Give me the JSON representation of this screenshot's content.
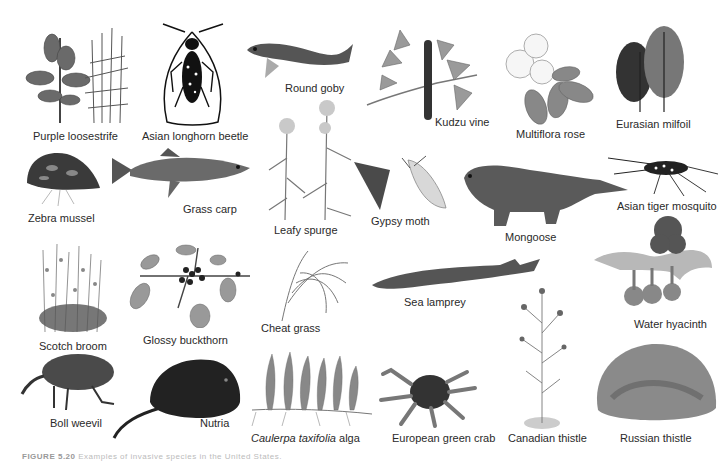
{
  "figure": {
    "caption_prefix": "FIGURE 5.20",
    "caption_text": "Examples of invasive species in the United States.",
    "species": [
      {
        "id": "purple-loosestrife",
        "label": "Purple loosestrife"
      },
      {
        "id": "asian-longhorn-beetle",
        "label": "Asian longhorn beetle"
      },
      {
        "id": "round-goby",
        "label": "Round goby"
      },
      {
        "id": "kudzu-vine",
        "label": "Kudzu vine"
      },
      {
        "id": "multiflora-rose",
        "label": "Multiflora rose"
      },
      {
        "id": "eurasian-milfoil",
        "label": "Eurasian milfoil"
      },
      {
        "id": "zebra-mussel",
        "label": "Zebra mussel"
      },
      {
        "id": "grass-carp",
        "label": "Grass carp"
      },
      {
        "id": "leafy-spurge",
        "label": "Leafy spurge"
      },
      {
        "id": "gypsy-moth",
        "label": "Gypsy moth"
      },
      {
        "id": "mongoose",
        "label": "Mongoose"
      },
      {
        "id": "asian-tiger-mosquito",
        "label": "Asian tiger mosquito"
      },
      {
        "id": "scotch-broom",
        "label": "Scotch broom"
      },
      {
        "id": "glossy-buckthorn",
        "label": "Glossy buckthorn"
      },
      {
        "id": "cheat-grass",
        "label": "Cheat grass"
      },
      {
        "id": "sea-lamprey",
        "label": "Sea lamprey"
      },
      {
        "id": "water-hyacinth",
        "label": "Water hyacinth"
      },
      {
        "id": "boll-weevil",
        "label": "Boll weevil"
      },
      {
        "id": "nutria",
        "label": "Nutria"
      },
      {
        "id": "caulerpa-taxifolia-alga",
        "label_italic": "Caulerpa taxifolia",
        "label_rest": " alga"
      },
      {
        "id": "european-green-crab",
        "label": "European green crab"
      },
      {
        "id": "canadian-thistle",
        "label": "Canadian thistle"
      },
      {
        "id": "russian-thistle",
        "label": "Russian thistle"
      }
    ]
  }
}
